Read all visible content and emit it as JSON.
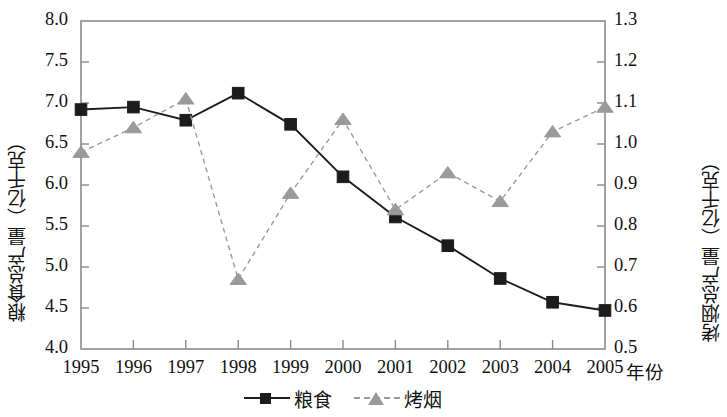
{
  "chart_data": {
    "type": "line",
    "title": "",
    "xlabel": "年份",
    "categories": [
      "1995",
      "1996",
      "1997",
      "1998",
      "1999",
      "2000",
      "2001",
      "2002",
      "2003",
      "2004",
      "2005"
    ],
    "grid": false,
    "legend_position": "bottom",
    "axes": {
      "left": {
        "label": "粮食总产量（亿千克）",
        "unit": "亿千克",
        "min": 4.0,
        "max": 8.0,
        "step": 0.5,
        "ticks": [
          "4.0",
          "4.5",
          "5.0",
          "5.5",
          "6.0",
          "6.5",
          "7.0",
          "7.5",
          "8.0"
        ]
      },
      "right": {
        "label": "烤烟总产量（亿千克）",
        "unit": "亿千克",
        "min": 0.5,
        "max": 1.3,
        "step": 0.1,
        "ticks": [
          "0.5",
          "0.6",
          "0.7",
          "0.8",
          "0.9",
          "1.0",
          "1.1",
          "1.2",
          "1.3"
        ]
      }
    },
    "series": [
      {
        "name": "粮食",
        "axis": "left",
        "marker": "square",
        "color": "#1c1c1c",
        "line_style": "solid",
        "values": [
          6.92,
          6.95,
          6.79,
          7.12,
          6.74,
          6.1,
          5.61,
          5.26,
          4.86,
          4.57,
          4.47
        ]
      },
      {
        "name": "烤烟",
        "axis": "right",
        "marker": "triangle",
        "color": "#9a9a9a",
        "line_style": "dashed",
        "values": [
          0.98,
          1.04,
          1.11,
          0.67,
          0.88,
          1.06,
          0.84,
          0.93,
          0.86,
          1.03,
          1.09
        ]
      }
    ]
  },
  "legend": {
    "items": [
      {
        "label": "粮食",
        "marker": "square",
        "color": "#1c1c1c",
        "line_style": "solid"
      },
      {
        "label": "烤烟",
        "marker": "triangle",
        "color": "#9a9a9a",
        "line_style": "dashed"
      }
    ]
  }
}
